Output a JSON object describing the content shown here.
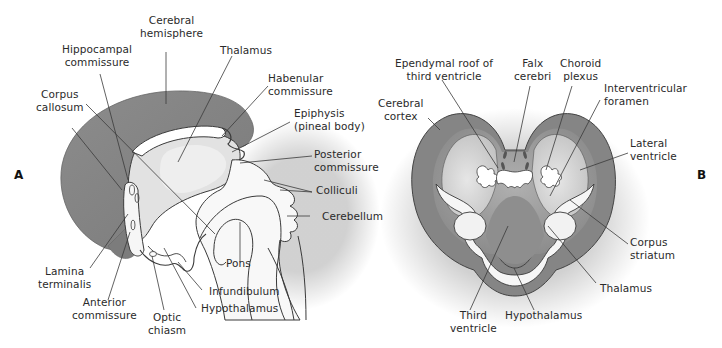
{
  "figure": {
    "panels": [
      {
        "id": "A",
        "label": "A"
      },
      {
        "id": "B",
        "label": "B"
      }
    ],
    "colors": {
      "cortex_dark": "#7f7f7f",
      "tissue_mid": "#a6a6a6",
      "tissue_light": "#d9d9d9",
      "ventricle": "#f4f4f4",
      "outline": "#3a3a3a",
      "leader": "#3a3a3a"
    }
  },
  "panel_a": {
    "labels": {
      "cerebral_hemisphere": "Cerebral\nhemisphere",
      "hippocampal_commissure": "Hippocampal\ncommissure",
      "thalamus": "Thalamus",
      "habenular_commissure": "Habenular\ncommissure",
      "corpus_callosum": "Corpus\ncallosum",
      "epiphysis": "Epiphysis\n(pineal body)",
      "posterior_commissure": "Posterior\ncommissure",
      "colliculi": "Colliculi",
      "cerebellum": "Cerebellum",
      "pons": "Pons",
      "lamina_terminalis": "Lamina\nterminalis",
      "anterior_commissure": "Anterior\ncommissure",
      "optic_chiasm": "Optic\nchiasm",
      "infundibulum": "Infundibulum",
      "hypothalamus": "Hypothalamus"
    }
  },
  "panel_b": {
    "labels": {
      "ependymal_roof": "Ependymal roof of\nthird ventricle",
      "falx_cerebri": "Falx\ncerebri",
      "choroid_plexus": "Choroid\nplexus",
      "interventricular_foramen": "Interventricular\nforamen",
      "cerebral_cortex": "Cerebral\ncortex",
      "lateral_ventricle": "Lateral\nventricle",
      "corpus_striatum": "Corpus\nstriatum",
      "thalamus": "Thalamus",
      "third_ventricle": "Third\nventricle",
      "hypothalamus": "Hypothalamus"
    }
  }
}
